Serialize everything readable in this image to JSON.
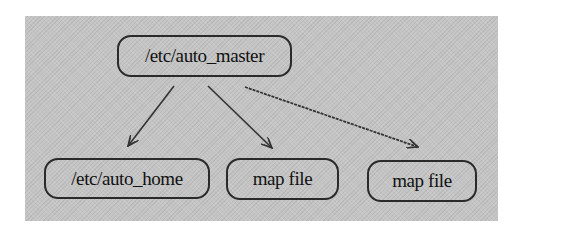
{
  "diagram": {
    "type": "tree",
    "colors": {
      "panel_background": "#c4c4c4",
      "node_border": "#2a2a2a",
      "edge": "#333333",
      "text": "#111111"
    },
    "root": {
      "id": "auto_master",
      "label": "/etc/auto_master"
    },
    "children": [
      {
        "id": "auto_home",
        "label": "/etc/auto_home"
      },
      {
        "id": "map_file_1",
        "label": "map file"
      },
      {
        "id": "map_file_2",
        "label": "map file"
      }
    ],
    "edges": [
      {
        "from": "auto_master",
        "to": "auto_home",
        "arrow": "open-arrowhead"
      },
      {
        "from": "auto_master",
        "to": "map_file_1",
        "arrow": "open-arrowhead"
      },
      {
        "from": "auto_master",
        "to": "map_file_2",
        "arrow": "open-arrowhead"
      }
    ]
  }
}
